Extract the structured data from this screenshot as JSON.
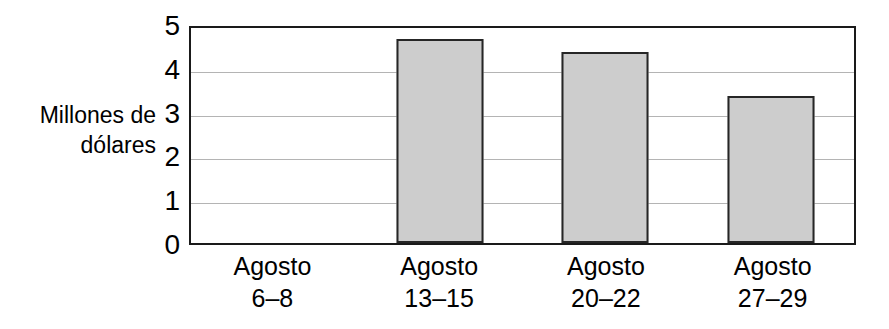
{
  "chart_data": {
    "type": "bar",
    "title": "",
    "xlabel": "",
    "ylabel": "Millones de\ndólares",
    "ylabel_lines": [
      "Millones de",
      "dólares"
    ],
    "categories": [
      "Agosto\n6–8",
      "Agosto\n13–15",
      "Agosto\n20–22",
      "Agosto\n27–29"
    ],
    "category_lines": [
      [
        "Agosto",
        "6–8"
      ],
      [
        "Agosto",
        "13–15"
      ],
      [
        "Agosto",
        "20–22"
      ],
      [
        "Agosto",
        "27–29"
      ]
    ],
    "values": [
      0,
      4.65,
      4.35,
      3.35
    ],
    "ylim": [
      0,
      5
    ],
    "yticks": [
      0,
      1,
      2,
      3,
      4,
      5
    ],
    "ytick_labels": [
      "0",
      "1",
      "2",
      "3",
      "4",
      "5"
    ],
    "grid": true,
    "grid_axis": "y",
    "legend": null,
    "colors": {
      "bar_fill": "#cdcdcd",
      "bar_border": "#262626",
      "axis": "#1a1a1a",
      "gridline": "#b4b4b4",
      "text": "#000000",
      "background": "#ffffff"
    }
  }
}
